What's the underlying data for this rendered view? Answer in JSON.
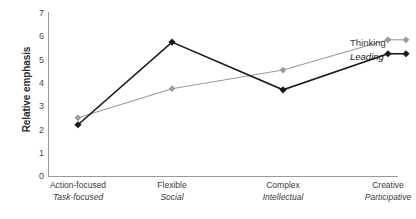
{
  "chart_data": {
    "type": "line",
    "title": "",
    "xlabel": "",
    "ylabel": "Relative emphasis",
    "ylim": [
      0,
      7
    ],
    "yticks": [
      0,
      1,
      2,
      3,
      4,
      5,
      6,
      7
    ],
    "ytick_labels": [
      "0",
      "1",
      "2",
      "3",
      "4",
      "5",
      "6",
      "7"
    ],
    "grid": false,
    "legend_position": "right",
    "categories": [
      "Action-focused\nTask-focused",
      "Flexible\nSocial",
      "Complex\nIntellectual",
      "Creative\nParticipative"
    ],
    "category_rows": [
      {
        "primary": "Action-focused",
        "secondary": "Task-focused"
      },
      {
        "primary": "Flexible",
        "secondary": "Social"
      },
      {
        "primary": "Complex",
        "secondary": "Intellectual"
      },
      {
        "primary": "Creative",
        "secondary": "Participative"
      }
    ],
    "series": [
      {
        "name": "Thinking",
        "values": [
          2.5,
          3.75,
          4.55,
          5.85
        ],
        "color": "#9a9a9a",
        "marker": "diamond",
        "italic": false
      },
      {
        "name": "Leading",
        "values": [
          2.2,
          5.75,
          3.7,
          5.25
        ],
        "color": "#1a1a1a",
        "marker": "diamond",
        "italic": true
      }
    ]
  },
  "axes": {
    "y_title": "Relative emphasis",
    "y_tick_labels": [
      "7",
      "6",
      "5",
      "4",
      "3",
      "2",
      "1",
      "0"
    ]
  },
  "legend": {
    "items": [
      {
        "label": "Thinking"
      },
      {
        "label": "Leading"
      }
    ]
  }
}
